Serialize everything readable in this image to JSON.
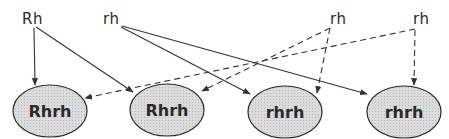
{
  "diagram": {
    "type": "genetic-cross",
    "parents": [
      {
        "id": "p1",
        "label": "Rh",
        "x": 22,
        "y": 11
      },
      {
        "id": "p2",
        "label": "rh",
        "x": 103,
        "y": 11
      },
      {
        "id": "p3",
        "label": "rh",
        "x": 330,
        "y": 11
      },
      {
        "id": "p4",
        "label": "rh",
        "x": 413,
        "y": 11
      }
    ],
    "offspring": [
      {
        "id": "o1",
        "label": "Rhrh",
        "cx": 50,
        "cy": 111
      },
      {
        "id": "o2",
        "label": "Rhrh",
        "cx": 167,
        "cy": 110
      },
      {
        "id": "o3",
        "label": "rhrh",
        "cx": 285,
        "cy": 112
      },
      {
        "id": "o4",
        "label": "rhrh",
        "cx": 404,
        "cy": 112
      }
    ],
    "edges": [
      {
        "from": "p1",
        "to": "o1",
        "style": "solid"
      },
      {
        "from": "p1",
        "to": "o2",
        "style": "solid"
      },
      {
        "from": "p2",
        "to": "o3",
        "style": "solid"
      },
      {
        "from": "p2",
        "to": "o4",
        "style": "solid"
      },
      {
        "from": "p3",
        "to": "o2",
        "style": "dashed"
      },
      {
        "from": "p3",
        "to": "o3",
        "style": "dashed"
      },
      {
        "from": "p4",
        "to": "o1",
        "style": "dashed"
      },
      {
        "from": "p4",
        "to": "o4",
        "style": "dashed"
      }
    ],
    "colors": {
      "line": "#333333",
      "ellipse_fill": "#d4d4d4",
      "ellipse_stroke": "#2a2a2a",
      "text": "#2a2a2a"
    }
  }
}
